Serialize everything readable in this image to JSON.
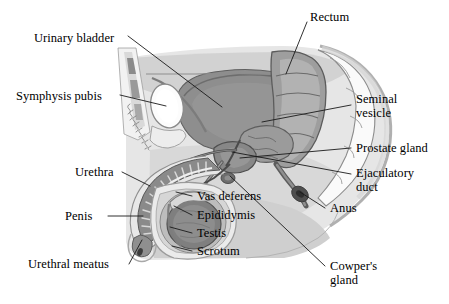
{
  "figure": {
    "background_color": "#ffffff",
    "line_color": "#1a1a1a",
    "text_color": "#000000"
  },
  "palette": {
    "body_light": "#e2e2e2",
    "body_mid": "#c9c9c9",
    "soft_tissue": "#b5b5b5",
    "organ_dark": "#8f8f8f",
    "organ_darker": "#6f6f6f",
    "outline": "#707070",
    "outline_dark": "#4a4a4a",
    "bone_white": "#fbfbfb",
    "rectum_fill": "#9e9e9e",
    "testis_fill": "#7d7d7d"
  },
  "labels": [
    {
      "id": "urinary-bladder",
      "text": "Urinary bladder",
      "x": 34,
      "y": 31,
      "align": "left"
    },
    {
      "id": "symphysis-pubis",
      "text": "Symphysis pubis",
      "x": 16,
      "y": 89,
      "align": "left"
    },
    {
      "id": "urethra",
      "text": "Urethra",
      "x": 75,
      "y": 165,
      "align": "left"
    },
    {
      "id": "penis",
      "text": "Penis",
      "x": 65,
      "y": 211,
      "align": "left"
    },
    {
      "id": "urethral-meatus",
      "text": "Urethral meatus",
      "x": 28,
      "y": 264,
      "align": "left"
    },
    {
      "id": "rectum",
      "text": "Rectum",
      "x": 310,
      "y": 10,
      "align": "left"
    },
    {
      "id": "seminal-vesicle",
      "text": "Seminal\nvesicle",
      "x": 355,
      "y": 99,
      "align": "left"
    },
    {
      "id": "prostate-gland",
      "text": "Prostate gland",
      "x": 355,
      "y": 143,
      "align": "left"
    },
    {
      "id": "ejaculatory-duct",
      "text": "Ejaculatory\nduct",
      "x": 355,
      "y": 168,
      "align": "left"
    },
    {
      "id": "anus",
      "text": "Anus",
      "x": 328,
      "y": 203,
      "align": "left"
    },
    {
      "id": "cowpers-gland",
      "text": "Cowper's\ngland",
      "x": 328,
      "y": 262,
      "align": "left"
    },
    {
      "id": "vas-deferens",
      "text": "Vas deferens",
      "x": 196,
      "y": 192,
      "align": "left"
    },
    {
      "id": "epididymis",
      "text": "Epididymis",
      "x": 196,
      "y": 211,
      "align": "left"
    },
    {
      "id": "testis",
      "text": "Testis",
      "x": 196,
      "y": 229,
      "align": "left"
    },
    {
      "id": "scrotum",
      "text": "Scrotum",
      "x": 196,
      "y": 247,
      "align": "left"
    }
  ],
  "leader_lines": [
    {
      "id": "leader-urinary-bladder",
      "points": "128,36 222,107"
    },
    {
      "id": "leader-symphysis-pubis",
      "points": "120,95 164,105"
    },
    {
      "id": "leader-urethra",
      "points": "122,172 146,184"
    },
    {
      "id": "leader-penis",
      "points": "108,216 140,216"
    },
    {
      "id": "leader-urethral-meatus",
      "points": "129,266 145,241"
    },
    {
      "id": "leader-rectum",
      "points": "307,21 285,74"
    },
    {
      "id": "leader-seminal-vesicle",
      "points": "351,105 260,122"
    },
    {
      "id": "leader-prostate-gland",
      "points": "351,148 238,138"
    },
    {
      "id": "leader-ejaculatory-duct",
      "points": "351,174 232,140"
    },
    {
      "id": "leader-anus",
      "points": "325,208 296,189"
    },
    {
      "id": "leader-cowpers-gland",
      "points": "325,267 229,152"
    },
    {
      "id": "leader-vas-deferens",
      "points": "192,196 178,192"
    },
    {
      "id": "leader-epididymis",
      "points": "192,215 172,205"
    },
    {
      "id": "leader-testis",
      "points": "192,233 168,226"
    },
    {
      "id": "leader-scrotum",
      "points": "192,251 170,246"
    }
  ],
  "structures": [
    {
      "id": "body-outline",
      "name": "body-region"
    },
    {
      "id": "urinary-bladder",
      "name": "urinary-bladder-organ"
    },
    {
      "id": "symphysis-pubis",
      "name": "symphysis-pubis-bone"
    },
    {
      "id": "rectum",
      "name": "rectum-organ"
    },
    {
      "id": "sacrum",
      "name": "sacrum-vertebrae"
    },
    {
      "id": "prostate-gland",
      "name": "prostate-gland-organ"
    },
    {
      "id": "seminal-vesicle",
      "name": "seminal-vesicle-organ"
    },
    {
      "id": "penis-shaft",
      "name": "penis-shaft"
    },
    {
      "id": "testis",
      "name": "testis-organ"
    },
    {
      "id": "epididymis",
      "name": "epididymis-organ"
    },
    {
      "id": "scrotum",
      "name": "scrotum-sac"
    },
    {
      "id": "vas-deferens",
      "name": "vas-deferens-duct"
    },
    {
      "id": "urethra",
      "name": "urethra-duct"
    },
    {
      "id": "anus",
      "name": "anus-opening"
    },
    {
      "id": "cowpers-gland",
      "name": "cowpers-gland-organ"
    }
  ]
}
